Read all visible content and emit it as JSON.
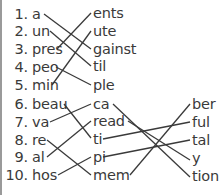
{
  "worksheet": {
    "part1": {
      "starts": [
        {
          "num": "1.",
          "text": "a"
        },
        {
          "num": "2.",
          "text": "un"
        },
        {
          "num": "3.",
          "text": "pres"
        },
        {
          "num": "4.",
          "text": "peo"
        },
        {
          "num": "5.",
          "text": "min"
        }
      ],
      "ends": [
        "ents",
        "ute",
        "gainst",
        "til",
        "ple"
      ],
      "matches": [
        [
          0,
          2
        ],
        [
          1,
          3
        ],
        [
          2,
          0
        ],
        [
          3,
          4
        ],
        [
          4,
          1
        ]
      ]
    },
    "part2": {
      "starts": [
        {
          "num": "6.",
          "text": "beau"
        },
        {
          "num": "7.",
          "text": "va"
        },
        {
          "num": "8.",
          "text": "re"
        },
        {
          "num": "9.",
          "text": "al"
        },
        {
          "num": "10.",
          "text": "hos"
        }
      ],
      "middles": [
        "ca",
        "read",
        "ti",
        "pi",
        "mem"
      ],
      "ends": [
        "ber",
        "ful",
        "tal",
        "y",
        "tion"
      ],
      "matches_start_middle": [
        [
          0,
          2
        ],
        [
          1,
          0
        ],
        [
          2,
          4
        ],
        [
          3,
          1
        ],
        [
          4,
          3
        ]
      ],
      "matches_middle_end": [
        [
          0,
          4
        ],
        [
          1,
          3
        ],
        [
          2,
          1
        ],
        [
          3,
          2
        ],
        [
          4,
          0
        ]
      ]
    }
  }
}
